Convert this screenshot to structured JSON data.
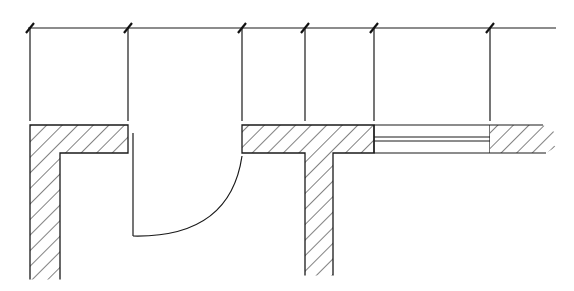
{
  "diagram": {
    "type": "architectural-floor-plan",
    "stroke_color": "#1a1a1a",
    "background": "#ffffff",
    "dimension_line": {
      "y": 28,
      "x_start": 28,
      "x_end": 556,
      "tick_positions_x": [
        30,
        128,
        242,
        305,
        374,
        490
      ]
    },
    "elements": [
      {
        "name": "left-wall-corner",
        "kind": "wall",
        "hatched": true
      },
      {
        "name": "door-opening",
        "kind": "door",
        "swing": "quarter-arc",
        "x_start": 128,
        "x_end": 242
      },
      {
        "name": "middle-wall-tee",
        "kind": "wall",
        "hatched": true
      },
      {
        "name": "window-opening",
        "kind": "window",
        "x_start": 374,
        "x_end": 490
      },
      {
        "name": "right-wall-break",
        "kind": "wall",
        "hatched": true,
        "break": "jagged"
      }
    ],
    "labels": []
  }
}
